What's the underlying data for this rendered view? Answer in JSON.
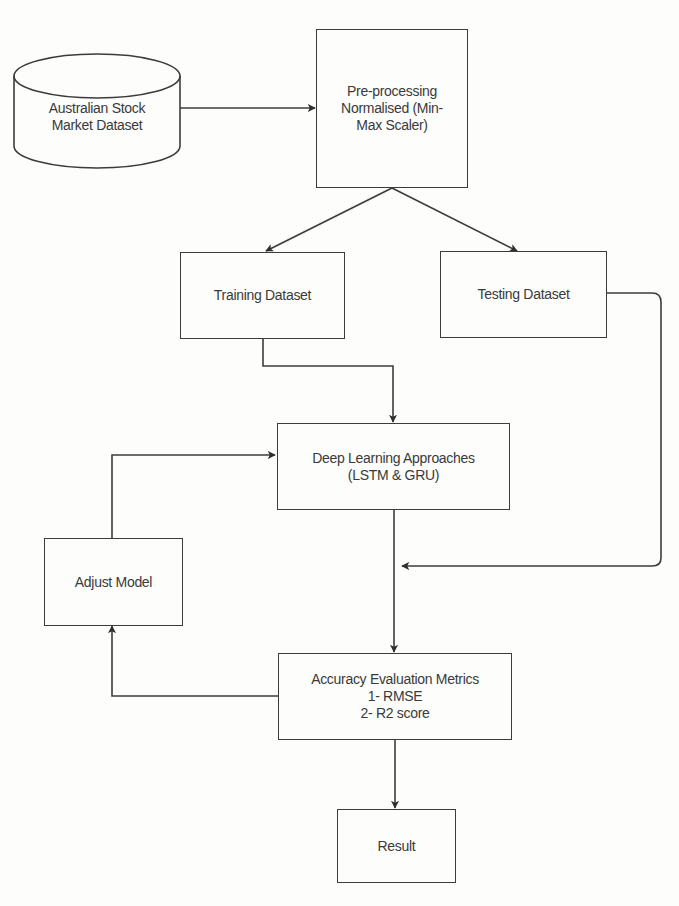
{
  "diagram": {
    "type": "flowchart",
    "nodes": {
      "dataset": {
        "shape": "cylinder",
        "label": "Australian Stock\nMarket Dataset"
      },
      "preprocessing": {
        "shape": "rectangle",
        "label": "Pre-processing\nNormalised (Min-\nMax Scaler)"
      },
      "training": {
        "shape": "rectangle",
        "label": "Training Dataset"
      },
      "testing": {
        "shape": "rectangle",
        "label": "Testing Dataset"
      },
      "deep_learning": {
        "shape": "rectangle",
        "label": "Deep Learning Approaches\n(LSTM & GRU)"
      },
      "adjust_model": {
        "shape": "rectangle",
        "label": "Adjust Model"
      },
      "accuracy": {
        "shape": "rectangle",
        "label": "Accuracy Evaluation Metrics\n1- RMSE\n2- R2 score"
      },
      "result": {
        "shape": "rectangle",
        "label": "Result"
      }
    },
    "edges": [
      {
        "from": "dataset",
        "to": "preprocessing"
      },
      {
        "from": "preprocessing",
        "to": "training"
      },
      {
        "from": "preprocessing",
        "to": "testing"
      },
      {
        "from": "training",
        "to": "deep_learning"
      },
      {
        "from": "testing",
        "to": "accuracy",
        "note": "joins the deep_learning to accuracy line"
      },
      {
        "from": "deep_learning",
        "to": "accuracy"
      },
      {
        "from": "accuracy",
        "to": "adjust_model"
      },
      {
        "from": "adjust_model",
        "to": "deep_learning"
      },
      {
        "from": "accuracy",
        "to": "result"
      }
    ],
    "colors": {
      "stroke": "#3c3c3c",
      "text": "#3a3a3a",
      "background": "#fdfdfb"
    }
  }
}
